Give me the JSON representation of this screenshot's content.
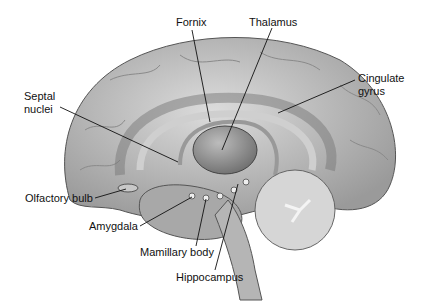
{
  "figure": {
    "colors": {
      "background": "#ffffff",
      "tissue": "#bdbdbd",
      "line": "#111111",
      "text": "#111111"
    }
  },
  "labels": [
    {
      "id": "fornix",
      "text": "Fornix",
      "x": 176,
      "y": 18,
      "anchor": [
        210,
        120
      ]
    },
    {
      "id": "thalamus",
      "text": "Thalamus",
      "x": 249,
      "y": 16,
      "anchor": [
        222,
        150
      ]
    },
    {
      "id": "cingulate",
      "text": "Cingulate",
      "x": 358,
      "y": 74,
      "anchor": [
        272,
        113
      ]
    },
    {
      "id": "cingulate2",
      "text": "gyrus",
      "x": 358,
      "y": 86
    },
    {
      "id": "septal",
      "text": "Septal",
      "x": 24,
      "y": 90,
      "anchor": [
        178,
        162
      ]
    },
    {
      "id": "septal2",
      "text": "nuclei",
      "x": 24,
      "y": 102
    },
    {
      "id": "olfactory",
      "text": "Olfactory bulb",
      "x": 25,
      "y": 193,
      "anchor": [
        128,
        188
      ]
    },
    {
      "id": "amygdala",
      "text": "Amygdala",
      "x": 89,
      "y": 220,
      "anchor": [
        192,
        196
      ]
    },
    {
      "id": "mamillary",
      "text": "Mamillary body",
      "x": 140,
      "y": 246,
      "anchor": [
        206,
        198
      ]
    },
    {
      "id": "hippocampus",
      "text": "Hippocampus",
      "x": 176,
      "y": 271,
      "anchor": [
        240,
        182
      ]
    }
  ]
}
